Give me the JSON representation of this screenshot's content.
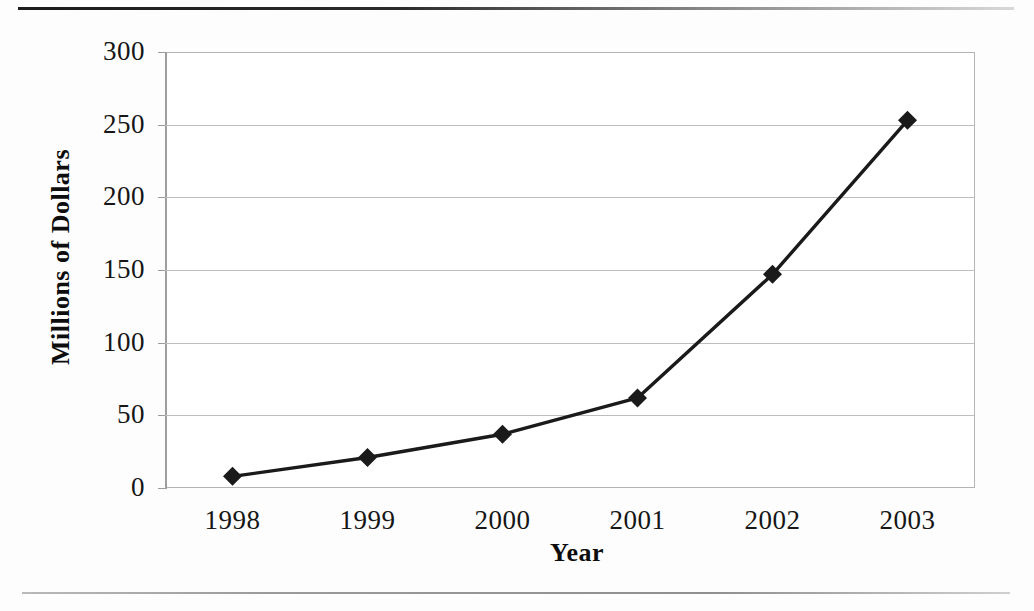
{
  "figure": {
    "rules": {
      "top_rule": "horizontal-rule-dark",
      "bottom_rule": "horizontal-rule-light"
    }
  },
  "chart_data": {
    "type": "line",
    "title": "",
    "xlabel": "Year",
    "ylabel": "Millions of Dollars",
    "categories": [
      "1998",
      "1999",
      "2000",
      "2001",
      "2002",
      "2003"
    ],
    "values": [
      8,
      21,
      37,
      62,
      147,
      253
    ],
    "series": [
      {
        "name": "Millions of Dollars",
        "values": [
          8,
          21,
          37,
          62,
          147,
          253
        ],
        "color": "#1a1a1a",
        "marker": "diamond"
      }
    ],
    "ylim": [
      0,
      300
    ],
    "ytick_labels": [
      "300",
      "250",
      "200",
      "150",
      "100",
      "50",
      "0"
    ],
    "ytick_values": [
      300,
      250,
      200,
      150,
      100,
      50,
      0
    ],
    "xtick_labels": [
      "1998",
      "1999",
      "2000",
      "2001",
      "2002",
      "2003"
    ],
    "grid": "horizontal",
    "legend": "none",
    "line_color": "#1a1a1a",
    "gridline_color": "#bdbdbd",
    "frame_color": "#b4b4b4",
    "background": "#ffffff"
  }
}
